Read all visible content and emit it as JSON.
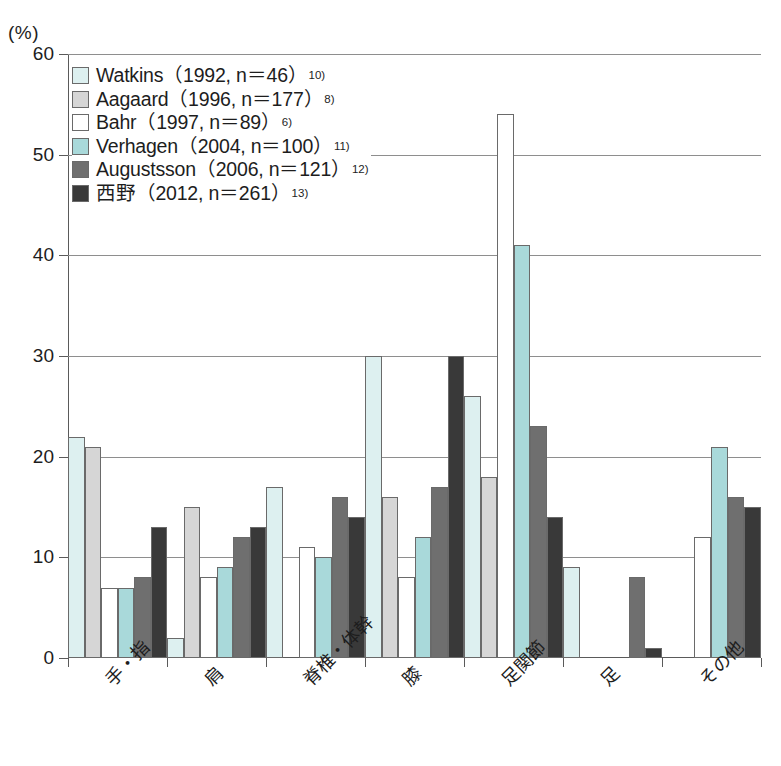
{
  "axis": {
    "unit_label": "(%)",
    "y_ticks": [
      "0",
      "10",
      "20",
      "30",
      "40",
      "50",
      "60"
    ],
    "y_min": 0,
    "y_max": 60
  },
  "legend": {
    "items": [
      {
        "label": "Watkins（1992, n＝46）",
        "sup": "10)",
        "color": "#ddf0f0",
        "name": "legend-item-watkins"
      },
      {
        "label": "Aagaard（1996, n＝177）",
        "sup": "8)",
        "color": "#d6d6d6",
        "name": "legend-item-aagaard"
      },
      {
        "label": "Bahr（1997, n＝89）",
        "sup": "6)",
        "color": "#ffffff",
        "name": "legend-item-bahr"
      },
      {
        "label": "Verhagen（2004, n＝100）",
        "sup": "11)",
        "color": "#a9d9da",
        "name": "legend-item-verhagen"
      },
      {
        "label": "Augustsson（2006, n＝121）",
        "sup": "12)",
        "color": "#6f6f6f",
        "name": "legend-item-augustsson"
      },
      {
        "label": "西野（2012, n＝261）",
        "sup": "13)",
        "color": "#393939",
        "name": "legend-item-nishino"
      }
    ]
  },
  "chart_data": {
    "type": "bar",
    "title": "",
    "subtitle": "",
    "xlabel": "",
    "ylabel": "(%)",
    "ylim": [
      0,
      60
    ],
    "ytick_step": 10,
    "grid": true,
    "legend_position": "inside-top-left",
    "categories": [
      "手・指",
      "肩",
      "脊椎・体幹",
      "膝",
      "足関節",
      "足",
      "その他"
    ],
    "series": [
      {
        "name": "Watkins（1992, n＝46）",
        "color": "#ddf0f0",
        "values": [
          22,
          2,
          17,
          30,
          26,
          9,
          null
        ]
      },
      {
        "name": "Aagaard（1996, n＝177）",
        "color": "#d6d6d6",
        "values": [
          21,
          15,
          null,
          16,
          18,
          null,
          null
        ]
      },
      {
        "name": "Bahr（1997, n＝89）",
        "color": "#ffffff",
        "values": [
          7,
          8,
          11,
          8,
          54,
          null,
          12
        ]
      },
      {
        "name": "Verhagen（2004, n＝100）",
        "color": "#a9d9da",
        "values": [
          7,
          9,
          10,
          12,
          41,
          null,
          21
        ]
      },
      {
        "name": "Augustsson（2006, n＝121）",
        "color": "#6f6f6f",
        "values": [
          8,
          12,
          16,
          17,
          23,
          8,
          16
        ]
      },
      {
        "name": "西野（2012, n＝261）",
        "color": "#393939",
        "values": [
          13,
          13,
          14,
          30,
          14,
          1,
          15
        ]
      }
    ]
  }
}
